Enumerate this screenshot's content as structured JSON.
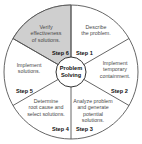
{
  "diagram": {
    "title": "Problem Solving",
    "center_line1": "Problem",
    "center_line2": "Solving",
    "colors": {
      "highlight_fill": "#cfcfcf",
      "stroke": "#555555",
      "text": "#4a4a4a",
      "background": "#ffffff"
    },
    "steps": [
      {
        "step": "Step 1",
        "text": "Describe\nthe problem."
      },
      {
        "step": "Step 2",
        "text": "Implement\ntemporary\ncontainment."
      },
      {
        "step": "Step 3",
        "text": "Analyze problem\nand generate\npotential\nsolutions."
      },
      {
        "step": "Step 4",
        "text": "Determine\nroot cause and\nselect solutions."
      },
      {
        "step": "Step 5",
        "text": "Implement\nsolutions."
      },
      {
        "step": "Step 6",
        "text": "Verify\neffectiveness\nof solutions.",
        "highlighted": true
      }
    ]
  }
}
